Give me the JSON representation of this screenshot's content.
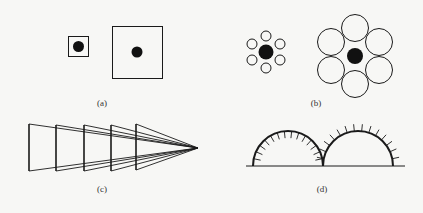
{
  "figure": {
    "panels": [
      {
        "id": "a",
        "label": "(a)",
        "description": "Small square with black dot; large square with same-size black dot"
      },
      {
        "id": "b",
        "label": "(b)",
        "description": "Black center circle surrounded by six small circles vs. same center circle surrounded by six large circles (Ebbinghaus illusion)"
      },
      {
        "id": "c",
        "label": "(c)",
        "description": "Five vertical bars of equal height converging to a vanishing point (perspective/size illusion)"
      },
      {
        "id": "d",
        "label": "(d)",
        "description": "Two equal semicircles on a baseline, left with inward ticks, right with outward ticks"
      }
    ],
    "colors": {
      "stroke": "#1a1a1a",
      "fill": "#111111",
      "background": "#f7f7f5"
    }
  }
}
